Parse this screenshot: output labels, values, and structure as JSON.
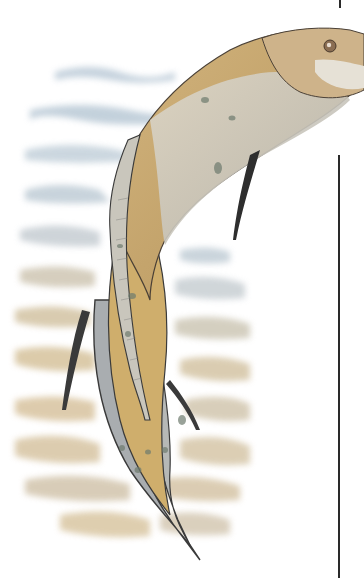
{
  "image": {
    "subject": "illustration of an eel-like prehistoric fish swimming upward over water and sandy seabed",
    "colors": {
      "background": "#ffffff",
      "body": "#c9ae7a",
      "body_dark": "#a88a5a",
      "belly": "#cfcbbf",
      "fin": "#9ea3a6",
      "water": "#b9c9d6",
      "sand": "#d8c3a0",
      "outline": "#3a3a3a",
      "rule": "#2a2a2a"
    }
  }
}
